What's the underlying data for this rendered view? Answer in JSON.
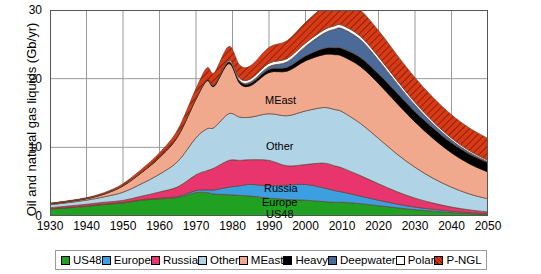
{
  "chart_data": {
    "type": "area",
    "title": "",
    "xlabel": "",
    "ylabel": "Oil and natural gas liquids (Gb/yr)",
    "xlim": [
      1930,
      2050
    ],
    "ylim": [
      0,
      30
    ],
    "grid": true,
    "stacked": true,
    "legend_position": "bottom",
    "xticks": [
      "1930",
      "1940",
      "1950",
      "1960",
      "1970",
      "1980",
      "1990",
      "2000",
      "2010",
      "2020",
      "2030",
      "2040",
      "2050"
    ],
    "yticks": [
      "0",
      "10",
      "20",
      "30"
    ],
    "x": [
      1930,
      1935,
      1940,
      1945,
      1950,
      1955,
      1960,
      1965,
      1970,
      1973,
      1975,
      1979,
      1982,
      1985,
      1990,
      1995,
      2000,
      2005,
      2008,
      2010,
      2015,
      2020,
      2025,
      2030,
      2035,
      2040,
      2045,
      2050
    ],
    "series": [
      {
        "name": "US48",
        "color": "#21A121",
        "values": [
          1.0,
          1.2,
          1.4,
          1.7,
          1.9,
          2.3,
          2.5,
          2.7,
          3.4,
          3.4,
          3.2,
          3.1,
          3.0,
          2.9,
          2.6,
          2.4,
          2.3,
          2.1,
          2.0,
          2.0,
          1.8,
          1.5,
          1.2,
          0.9,
          0.7,
          0.5,
          0.35,
          0.25
        ]
      },
      {
        "name": "Europe",
        "color": "#3C9FE0",
        "values": [
          0.05,
          0.05,
          0.06,
          0.06,
          0.07,
          0.08,
          0.1,
          0.15,
          0.3,
          0.4,
          0.6,
          1.1,
          1.4,
          1.7,
          1.8,
          2.1,
          2.3,
          2.0,
          1.7,
          1.5,
          1.1,
          0.8,
          0.55,
          0.4,
          0.28,
          0.2,
          0.14,
          0.1
        ]
      },
      {
        "name": "Russia",
        "color": "#E8356D",
        "values": [
          0.15,
          0.2,
          0.25,
          0.25,
          0.3,
          0.5,
          0.9,
          1.4,
          2.3,
          2.8,
          3.2,
          3.9,
          3.7,
          3.6,
          3.7,
          2.8,
          2.9,
          3.6,
          3.6,
          3.5,
          3.0,
          2.4,
          1.8,
          1.3,
          0.9,
          0.6,
          0.4,
          0.25
        ]
      },
      {
        "name": "Other",
        "color": "#B0D4E6",
        "values": [
          0.45,
          0.5,
          0.6,
          0.8,
          1.2,
          1.8,
          2.6,
          3.7,
          5.4,
          6.1,
          5.9,
          6.8,
          6.3,
          6.2,
          6.8,
          7.3,
          7.8,
          8.1,
          8.2,
          8.2,
          7.6,
          6.6,
          5.5,
          4.5,
          3.6,
          2.9,
          2.3,
          1.9
        ]
      },
      {
        "name": "MEast",
        "color": "#F0A98C",
        "values": [
          0.1,
          0.15,
          0.2,
          0.4,
          0.9,
          1.6,
          2.4,
          3.6,
          5.6,
          7.0,
          6.0,
          7.3,
          4.9,
          4.6,
          6.0,
          6.5,
          7.3,
          7.7,
          8.0,
          8.1,
          8.3,
          8.0,
          7.4,
          6.6,
          5.8,
          5.0,
          4.4,
          3.9
        ]
      },
      {
        "name": "Heavy",
        "color": "#000000",
        "values": [
          0.05,
          0.05,
          0.06,
          0.07,
          0.08,
          0.09,
          0.1,
          0.12,
          0.15,
          0.18,
          0.2,
          0.25,
          0.3,
          0.35,
          0.45,
          0.55,
          0.7,
          0.9,
          1.0,
          1.1,
          1.3,
          1.4,
          1.5,
          1.5,
          1.5,
          1.45,
          1.4,
          1.35
        ]
      },
      {
        "name": "Deepwater",
        "color": "#4A6A9A",
        "values": [
          0,
          0,
          0,
          0,
          0,
          0,
          0,
          0,
          0,
          0,
          0.02,
          0.05,
          0.1,
          0.2,
          0.4,
          0.8,
          1.4,
          2.2,
          2.7,
          2.9,
          2.6,
          2.0,
          1.4,
          0.95,
          0.6,
          0.4,
          0.25,
          0.15
        ]
      },
      {
        "name": "Polar",
        "color": "#FFFFFF",
        "values": [
          0,
          0,
          0,
          0,
          0,
          0,
          0,
          0,
          0,
          0,
          0.05,
          0.2,
          0.35,
          0.45,
          0.5,
          0.5,
          0.5,
          0.5,
          0.5,
          0.5,
          0.5,
          0.5,
          0.45,
          0.4,
          0.35,
          0.3,
          0.25,
          0.2
        ]
      },
      {
        "name": "P-NGL",
        "color": "#D93A16",
        "values": [
          0.05,
          0.07,
          0.1,
          0.15,
          0.25,
          0.4,
          0.6,
          0.9,
          1.4,
          1.7,
          1.7,
          2.0,
          1.9,
          1.9,
          2.3,
          2.6,
          3.0,
          3.4,
          3.6,
          3.7,
          3.8,
          3.8,
          3.7,
          3.6,
          3.5,
          3.4,
          3.3,
          3.2
        ]
      }
    ],
    "inline_labels": [
      {
        "text": "MEast",
        "x": 265,
        "y": 94
      },
      {
        "text": "Other",
        "x": 266,
        "y": 140
      },
      {
        "text": "Russia",
        "x": 264,
        "y": 182
      },
      {
        "text": "Europe",
        "x": 262,
        "y": 196
      },
      {
        "text": "US48",
        "x": 266,
        "y": 208
      }
    ]
  },
  "legend": {
    "items": [
      {
        "label": "US48",
        "color": "#21A121"
      },
      {
        "label": "Europe",
        "color": "#3C9FE0"
      },
      {
        "label": "Russia",
        "color": "#E8356D"
      },
      {
        "label": "Other",
        "color": "#B0D4E6"
      },
      {
        "label": "MEast",
        "color": "#F0A98C"
      },
      {
        "label": "Heavy",
        "color": "#000000"
      },
      {
        "label": "Deepwater",
        "color": "#4A6A9A"
      },
      {
        "label": "Polar",
        "color": "#FFFFFF"
      },
      {
        "label": "P-NGL",
        "color": "#D93A16"
      }
    ]
  }
}
